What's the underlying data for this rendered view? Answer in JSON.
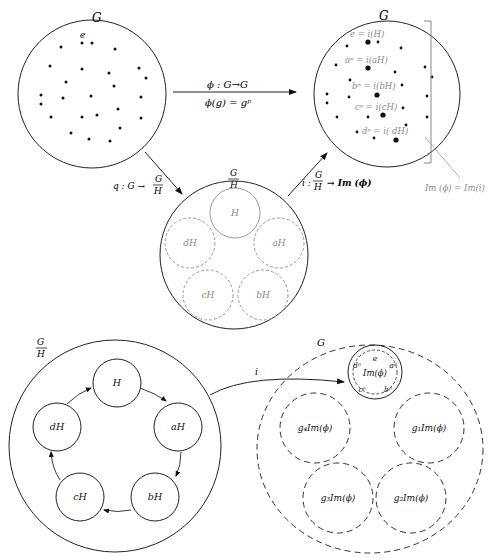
{
  "top_left_group": {
    "label": "G",
    "identity_label": "e",
    "dot_count": 27
  },
  "phi_arrow": {
    "signature": "ϕ : G→G",
    "definition": "ϕ(g) = gᵖ"
  },
  "q_arrow": {
    "label_prefix": "q : G →",
    "frac_num": "G",
    "frac_den": "H"
  },
  "i_arrow": {
    "label_prefix": "i :",
    "frac_num": "G",
    "frac_den": "H",
    "label_suffix": "→ Im (ϕ)"
  },
  "quotient_top": {
    "frac_num": "G",
    "frac_den": "H",
    "cosets": [
      "H",
      "aH",
      "bH",
      "cH",
      "dH"
    ]
  },
  "top_right_group": {
    "label": "G",
    "mappings": [
      "e = i(H)",
      "aᵖ = i(aH)",
      "bᵖ = i(bH)",
      "cᵖ = i(cH)",
      "dᵖ = i( dH)"
    ],
    "bracket_label": "Im (ϕ) = Im(i)"
  },
  "quotient_bottom": {
    "frac_num": "G",
    "frac_den": "H",
    "cycle": [
      "H",
      "aH",
      "bH",
      "cH",
      "dH"
    ]
  },
  "bottom_arrow_label": "i",
  "bottom_right_group": {
    "label": "G",
    "image_label": "Im(ϕ)",
    "image_elements": [
      "e",
      "aᵖ",
      "bᵖ",
      "cᵖ",
      "dᵖ"
    ],
    "cosets": [
      "g₁Im(ϕ)",
      "g₂Im(ϕ)",
      "g₃Im(ϕ)",
      "g₄Im(ϕ)"
    ]
  }
}
